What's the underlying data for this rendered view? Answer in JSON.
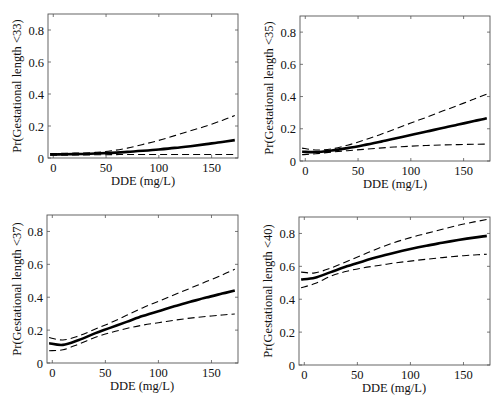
{
  "figure": {
    "x_range": [
      -5,
      175
    ],
    "y_range": [
      0,
      0.9
    ]
  },
  "chart_data": [
    {
      "type": "line",
      "title": "",
      "xlabel": "DDE (mg/L)",
      "ylabel": "Pr(Gestational length <33)",
      "xticks": [
        0,
        50,
        100,
        150
      ],
      "yticks": [
        0,
        0.2,
        0.4,
        0.6,
        0.8
      ],
      "ytick_labels": [
        "0",
        "0.2",
        "0.4",
        "0.6",
        "0.8"
      ],
      "xlim": [
        -5,
        175
      ],
      "ylim": [
        0,
        0.9
      ],
      "grid": false,
      "legend": "none",
      "x": [
        -3,
        10,
        25,
        40,
        55,
        70,
        85,
        100,
        115,
        130,
        145,
        160,
        172
      ],
      "series": [
        {
          "name": "estimate",
          "style": "solid",
          "values": [
            0.022,
            0.023,
            0.025,
            0.028,
            0.032,
            0.038,
            0.045,
            0.053,
            0.063,
            0.074,
            0.087,
            0.1,
            0.112
          ]
        },
        {
          "name": "upper 95% CI",
          "style": "dashed",
          "values": [
            0.028,
            0.029,
            0.031,
            0.035,
            0.045,
            0.062,
            0.085,
            0.11,
            0.14,
            0.17,
            0.2,
            0.235,
            0.265
          ]
        },
        {
          "name": "lower 95% CI",
          "style": "dashed",
          "values": [
            0.017,
            0.018,
            0.019,
            0.02,
            0.021,
            0.022,
            0.022,
            0.022,
            0.022,
            0.022,
            0.022,
            0.022,
            0.022
          ]
        }
      ]
    },
    {
      "type": "line",
      "title": "",
      "xlabel": "DDE (mg/L)",
      "ylabel": "Pr(Gestational length <35)",
      "xticks": [
        0,
        50,
        100,
        150
      ],
      "yticks": [
        0,
        0.2,
        0.4,
        0.6,
        0.8
      ],
      "ytick_labels": [
        "0",
        "0.2",
        "0.4",
        "0.6",
        "0.8"
      ],
      "xlim": [
        -5,
        175
      ],
      "ylim": [
        0,
        0.9
      ],
      "grid": false,
      "legend": "none",
      "x": [
        -3,
        10,
        25,
        40,
        55,
        70,
        85,
        100,
        115,
        130,
        145,
        160,
        172
      ],
      "series": [
        {
          "name": "estimate",
          "style": "solid",
          "values": [
            0.058,
            0.055,
            0.065,
            0.08,
            0.098,
            0.118,
            0.14,
            0.162,
            0.183,
            0.205,
            0.226,
            0.248,
            0.265
          ]
        },
        {
          "name": "upper 95% CI",
          "style": "dashed",
          "values": [
            0.08,
            0.068,
            0.075,
            0.098,
            0.128,
            0.162,
            0.198,
            0.236,
            0.272,
            0.31,
            0.346,
            0.385,
            0.415
          ]
        },
        {
          "name": "lower 95% CI",
          "style": "dashed",
          "values": [
            0.04,
            0.045,
            0.055,
            0.064,
            0.072,
            0.08,
            0.087,
            0.092,
            0.096,
            0.1,
            0.102,
            0.104,
            0.105
          ]
        }
      ]
    },
    {
      "type": "line",
      "title": "",
      "xlabel": "DDE (mg/L)",
      "ylabel": "Pr(Gestational length <37)",
      "xticks": [
        0,
        50,
        100,
        150
      ],
      "yticks": [
        0,
        0.2,
        0.4,
        0.6,
        0.8
      ],
      "ytick_labels": [
        "0",
        "0.2",
        "0.4",
        "0.6",
        "0.8"
      ],
      "xlim": [
        -5,
        175
      ],
      "ylim": [
        0,
        0.9
      ],
      "grid": false,
      "legend": "none",
      "x": [
        -3,
        10,
        25,
        40,
        55,
        70,
        85,
        100,
        115,
        130,
        145,
        160,
        172
      ],
      "series": [
        {
          "name": "estimate",
          "style": "solid",
          "values": [
            0.12,
            0.11,
            0.14,
            0.18,
            0.215,
            0.25,
            0.285,
            0.315,
            0.345,
            0.372,
            0.398,
            0.422,
            0.44
          ]
        },
        {
          "name": "upper 95% CI",
          "style": "dashed",
          "values": [
            0.155,
            0.14,
            0.165,
            0.205,
            0.245,
            0.29,
            0.335,
            0.375,
            0.415,
            0.455,
            0.495,
            0.535,
            0.57
          ]
        },
        {
          "name": "lower 95% CI",
          "style": "dashed",
          "values": [
            0.075,
            0.08,
            0.115,
            0.155,
            0.185,
            0.21,
            0.23,
            0.245,
            0.26,
            0.273,
            0.283,
            0.292,
            0.298
          ]
        }
      ]
    },
    {
      "type": "line",
      "title": "",
      "xlabel": "DDE (mg/L)",
      "ylabel": "Pr(Gestational length <40)",
      "xticks": [
        0,
        50,
        100,
        150
      ],
      "yticks": [
        0,
        0.2,
        0.4,
        0.6,
        0.8
      ],
      "ytick_labels": [
        "0",
        "0.2",
        "0.4",
        "0.6",
        "0.8"
      ],
      "xlim": [
        -5,
        175
      ],
      "ylim": [
        0,
        0.9
      ],
      "grid": false,
      "legend": "none",
      "x": [
        -3,
        10,
        25,
        40,
        55,
        70,
        85,
        100,
        115,
        130,
        145,
        160,
        172
      ],
      "series": [
        {
          "name": "estimate",
          "style": "solid",
          "values": [
            0.52,
            0.53,
            0.565,
            0.6,
            0.63,
            0.658,
            0.683,
            0.705,
            0.725,
            0.743,
            0.76,
            0.775,
            0.785
          ]
        },
        {
          "name": "upper 95% CI",
          "style": "dashed",
          "values": [
            0.565,
            0.56,
            0.59,
            0.63,
            0.67,
            0.71,
            0.745,
            0.775,
            0.8,
            0.825,
            0.85,
            0.87,
            0.885
          ]
        },
        {
          "name": "lower 95% CI",
          "style": "dashed",
          "values": [
            0.47,
            0.495,
            0.54,
            0.57,
            0.59,
            0.605,
            0.62,
            0.632,
            0.643,
            0.653,
            0.662,
            0.669,
            0.674
          ]
        }
      ]
    }
  ],
  "panels": [
    {
      "ylabel": "Pr(Gestational length <33)",
      "xlabel": "DDE (mg/L)"
    },
    {
      "ylabel": "Pr(Gestational length <35)",
      "xlabel": "DDE (mg/L)"
    },
    {
      "ylabel": "Pr(Gestational length <37)",
      "xlabel": "DDE (mg/L)"
    },
    {
      "ylabel": "Pr(Gestational length <40)",
      "xlabel": "DDE (mg/L)"
    }
  ]
}
